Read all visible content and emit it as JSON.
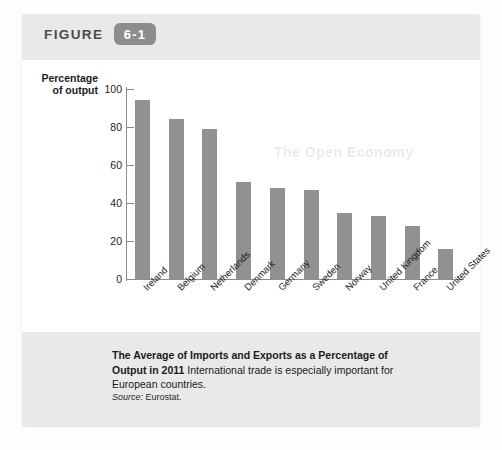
{
  "figure": {
    "label": "FIGURE",
    "number": "6-1"
  },
  "chart_data": {
    "type": "bar",
    "title": "The Average of Imports and Exports as a Percentage of Output in 2011",
    "xlabel": "",
    "ylabel": "Percentage of output",
    "ylim": [
      0,
      100
    ],
    "yticks": [
      "0",
      "20",
      "40",
      "60",
      "80",
      "100"
    ],
    "grid": false,
    "legend": "none",
    "bar_color": "#919191",
    "categories": [
      "Ireland",
      "Belgium",
      "Netherlands",
      "Denmark",
      "Germany",
      "Sweden",
      "Norway",
      "United Kingdom",
      "France",
      "United States"
    ],
    "values": [
      94,
      84,
      79,
      51,
      48,
      47,
      35,
      33,
      28,
      16
    ]
  },
  "caption": {
    "bold": "The Average of Imports and Exports as a Percentage of Output in 2011",
    "rest": " International trade is especially important for European countries.",
    "source_label": "Source:",
    "source_value": " Eurostat."
  },
  "bleed_text": {
    "line1": "The Open Economy"
  },
  "colors": {
    "panel_background": "#e9e9e9",
    "plot_background": "#ffffff",
    "bar": "#919191",
    "axis": "#8b8b8b",
    "badge": "#8d8d8d"
  }
}
